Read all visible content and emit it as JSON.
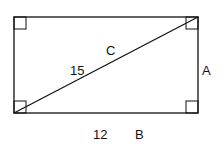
{
  "diagram": {
    "shape": "rectangle with diagonal",
    "labels": {
      "diagonal_name": "C",
      "diagonal_length": "15",
      "side_right_name": "A",
      "bottom_length": "12",
      "bottom_name": "B"
    },
    "right_angle_marks": 4,
    "colors": {
      "stroke": "#111111",
      "background": "#ffffff"
    }
  }
}
